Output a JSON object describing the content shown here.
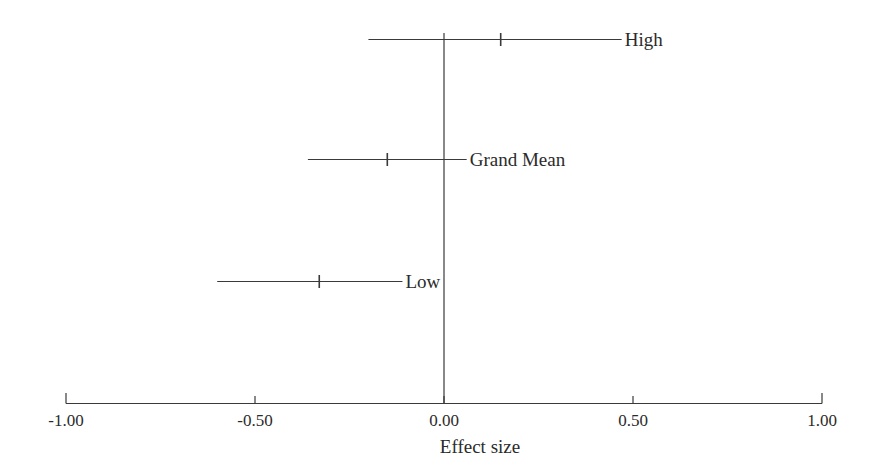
{
  "chart_data": {
    "type": "scatter",
    "subtype": "forest-plot",
    "title": "",
    "xlabel": "Effect size",
    "ylabel": "",
    "xlim": [
      -1.0,
      1.0
    ],
    "grid": false,
    "legend": null,
    "reference_line": {
      "x": 0.0,
      "label": "0.00"
    },
    "xticks": [
      {
        "value": -1.0,
        "label": "-1.00"
      },
      {
        "value": -0.5,
        "label": "-0.50"
      },
      {
        "value": 0.0,
        "label": "0.00"
      },
      {
        "value": 0.5,
        "label": "0.50"
      },
      {
        "value": 1.0,
        "label": "1.00"
      }
    ],
    "categories": [
      "High",
      "Grand Mean",
      "Low"
    ],
    "rows": [
      {
        "label": "High",
        "estimate": 0.15,
        "ci_low": -0.2,
        "ci_high": 0.47
      },
      {
        "label": "Grand Mean",
        "estimate": -0.15,
        "ci_low": -0.36,
        "ci_high": 0.06
      },
      {
        "label": "Low",
        "estimate": -0.33,
        "ci_low": -0.6,
        "ci_high": -0.11
      }
    ],
    "colors": {
      "line": "#3a3a3a",
      "axis": "#3a3a3a",
      "text": "#2b2b2b",
      "background": "#ffffff"
    }
  },
  "axis": {
    "title": "Effect size",
    "tick_labels": [
      "-1.00",
      "-0.50",
      "0.00",
      "0.50",
      "1.00"
    ]
  },
  "series_labels": {
    "high": "High",
    "grand_mean": "Grand Mean",
    "low": "Low"
  }
}
